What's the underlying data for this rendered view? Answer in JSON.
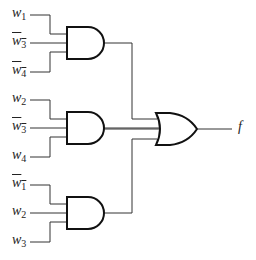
{
  "diagram": {
    "type": "logic-circuit",
    "gates": [
      {
        "id": "and1",
        "type": "AND",
        "inputs": [
          {
            "name": "w",
            "sub": "1",
            "negated": false
          },
          {
            "name": "w",
            "sub": "3",
            "negated": true
          },
          {
            "name": "w",
            "sub": "4",
            "negated": true
          }
        ]
      },
      {
        "id": "and2",
        "type": "AND",
        "inputs": [
          {
            "name": "w",
            "sub": "2",
            "negated": false
          },
          {
            "name": "w",
            "sub": "3",
            "negated": true
          },
          {
            "name": "w",
            "sub": "4",
            "negated": false
          }
        ]
      },
      {
        "id": "and3",
        "type": "AND",
        "inputs": [
          {
            "name": "w",
            "sub": "1",
            "negated": true
          },
          {
            "name": "w",
            "sub": "2",
            "negated": false
          },
          {
            "name": "w",
            "sub": "3",
            "negated": false
          }
        ]
      },
      {
        "id": "or1",
        "type": "OR",
        "inputs": [
          "and1",
          "and2",
          "and3"
        ]
      }
    ],
    "output": {
      "label": "f"
    },
    "labels": {
      "in1": {
        "v": "w",
        "s": "1"
      },
      "in2": {
        "v": "w",
        "s": "3"
      },
      "in3": {
        "v": "w",
        "s": "4"
      },
      "in4": {
        "v": "w",
        "s": "2"
      },
      "in5": {
        "v": "w",
        "s": "3"
      },
      "in6": {
        "v": "w",
        "s": "4"
      },
      "in7": {
        "v": "w",
        "s": "1"
      },
      "in8": {
        "v": "w",
        "s": "2"
      },
      "in9": {
        "v": "w",
        "s": "3"
      },
      "out": "f"
    }
  }
}
